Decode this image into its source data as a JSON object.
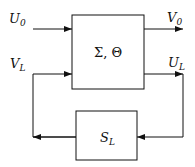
{
  "diagram": {
    "main_block": {
      "label": "Σ, Θ"
    },
    "load_block": {
      "label": "S",
      "label_sub": "L"
    },
    "signals": {
      "u0": {
        "label": "U",
        "sub": "0"
      },
      "v0": {
        "label": "V",
        "sub": "0"
      },
      "vl": {
        "label": "V",
        "sub": "L"
      },
      "ul": {
        "label": "U",
        "sub": "L"
      }
    },
    "colors": {
      "stroke": "#111111",
      "background": "#ffffff"
    }
  }
}
